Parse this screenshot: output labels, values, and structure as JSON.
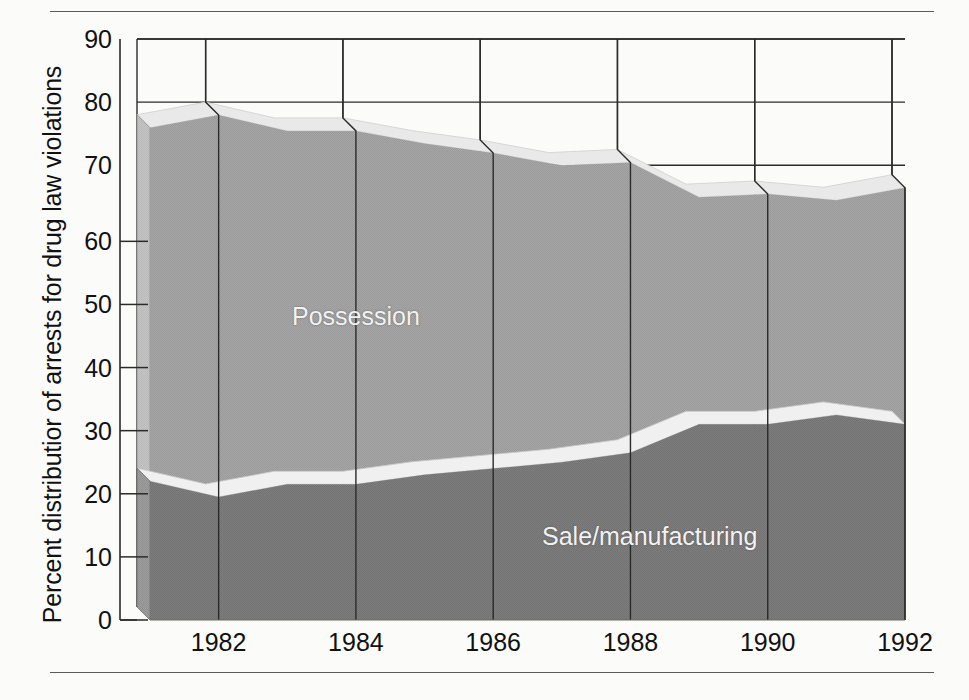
{
  "page": {
    "clipped_header_text": "",
    "top_rule": true,
    "bottom_rule": true
  },
  "chart_data": {
    "type": "area",
    "stacked": true,
    "title": "",
    "subtitle": "",
    "xlabel": "",
    "ylabel": "Percent distributior of arrests for drug law violations",
    "ylim": [
      0,
      90
    ],
    "xlim": [
      1981,
      1992
    ],
    "ytick_labels": [
      "0",
      "10",
      "20",
      "30",
      "40",
      "50",
      "60",
      "70",
      "80",
      "90"
    ],
    "ytick_values": [
      0,
      10,
      20,
      30,
      40,
      50,
      60,
      70,
      80,
      90
    ],
    "xtick_labels": [
      "1982",
      "1984",
      "1986",
      "1988",
      "1990",
      "1992"
    ],
    "xtick_values": [
      1982,
      1984,
      1986,
      1988,
      1990,
      1992
    ],
    "x": [
      1981,
      1982,
      1983,
      1984,
      1985,
      1986,
      1987,
      1988,
      1989,
      1990,
      1991,
      1992
    ],
    "series": [
      {
        "name": "Sale/manufacturing",
        "label": "Sale/manufacturing",
        "color": "#7c7c7c",
        "values": [
          22,
          19.5,
          21.5,
          21.5,
          23,
          24,
          25,
          26.5,
          31,
          31,
          32.5,
          31
        ]
      },
      {
        "name": "Possession",
        "label": "Possession",
        "color": "#a3a3a3",
        "values": [
          56,
          60.5,
          56,
          56,
          52.5,
          50,
          47,
          46,
          36,
          36.5,
          34,
          37.5
        ]
      }
    ],
    "cumulative_top": [
      78,
      80,
      77.5,
      77.5,
      75.5,
      74,
      72,
      72.5,
      67,
      67.5,
      66.5,
      68.5
    ],
    "gridlines": {
      "horizontal_full_width_at": [
        90,
        80,
        70
      ],
      "vertical_at_years": [
        1982,
        1984,
        1986,
        1988,
        1990,
        1992
      ],
      "minor_ticks_at": [
        0,
        10,
        20,
        30,
        40,
        50,
        60
      ]
    },
    "style": {
      "three_d": true,
      "depth_px": 13,
      "band_light": "#a3a3a3",
      "band_dark": "#7c7c7c",
      "side_light": "#c6c6c6",
      "side_dark": "#9a9a9a",
      "top_highlight": "#e9e9e9",
      "axis_color": "#2b2b2b",
      "grid_color": "#2b2b2b",
      "label_text_color": "#f2f2f2"
    }
  }
}
